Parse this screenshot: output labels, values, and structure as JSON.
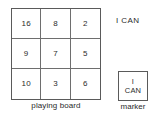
{
  "figure": {
    "background_color": "#ffffff",
    "line_color": "#5a5a5a",
    "text_color": "#2b2b2b"
  },
  "board": {
    "caption": "playing board",
    "rows": [
      [
        "16",
        "8",
        "2"
      ],
      [
        "9",
        "7",
        "5"
      ],
      [
        "10",
        "3",
        "6"
      ]
    ]
  },
  "legend": {
    "ican_label": "I CAN"
  },
  "marker": {
    "caption": "marker",
    "line1": "I",
    "line2": "CAN"
  }
}
